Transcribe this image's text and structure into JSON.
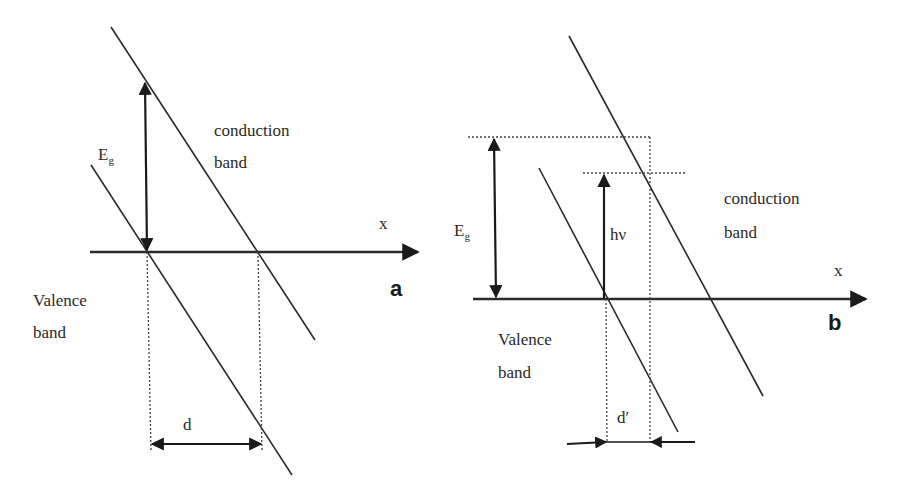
{
  "diagram": {
    "panels": [
      {
        "id": "a",
        "panel_label": "a",
        "axis_label": "x",
        "gap_label_main": "E",
        "gap_label_sub": "g",
        "conduction_label_line1": "conduction",
        "conduction_label_line2": "band",
        "valence_label_line1": "Valence",
        "valence_label_line2": "band",
        "distance_label": "d"
      },
      {
        "id": "b",
        "panel_label": "b",
        "axis_label": "x",
        "gap_label_main": "E",
        "gap_label_sub": "g",
        "photon_label": "hν",
        "conduction_label_line1": "conduction",
        "conduction_label_line2": "band",
        "valence_label_line1": "Valence",
        "valence_label_line2": "band",
        "distance_label": "d′"
      }
    ],
    "colors": {
      "line": "#2a2a2a",
      "background": "#ffffff"
    }
  }
}
